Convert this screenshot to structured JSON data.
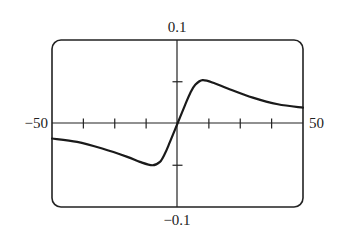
{
  "chart_data": {
    "type": "line",
    "title": "",
    "xlabel": "",
    "ylabel": "",
    "xlim": [
      -50,
      50
    ],
    "ylim": [
      -0.1,
      0.1
    ],
    "x_tick_spacing": 12.5,
    "y_tick_spacing": 0.05,
    "grid": false,
    "legend": "none",
    "labels": {
      "x_min": "−50",
      "x_max": "50",
      "y_max": "0.1",
      "y_min": "−0.1"
    },
    "series": [
      {
        "name": "f(x)",
        "x": [
          -50,
          -40,
          -30,
          -20,
          -15,
          -10,
          -7,
          -5,
          -3,
          0,
          3,
          5,
          7,
          10,
          15,
          20,
          30,
          40,
          50
        ],
        "y": [
          -0.018,
          -0.022,
          -0.03,
          -0.04,
          -0.046,
          -0.05,
          -0.046,
          -0.036,
          -0.022,
          0.0,
          0.022,
          0.036,
          0.046,
          0.052,
          0.048,
          0.042,
          0.031,
          0.023,
          0.019
        ]
      }
    ]
  }
}
